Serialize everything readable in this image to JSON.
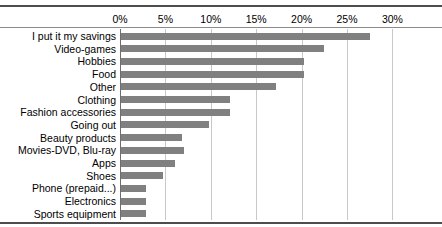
{
  "chart_data": {
    "type": "bar",
    "orientation": "horizontal",
    "title": "",
    "xlabel": "",
    "ylabel": "",
    "xlim": [
      0,
      30
    ],
    "xtick_labels": [
      "0%",
      "5%",
      "10%",
      "15%",
      "20%",
      "25%",
      "30%"
    ],
    "xticks": [
      0,
      5,
      10,
      15,
      20,
      25,
      30
    ],
    "grid": true,
    "legend": "none",
    "bar_color": "#808080",
    "gridline_color": "#c8c8c8",
    "axis_color": "#6e6e6e",
    "categories": [
      "I put it my savings",
      "Video-games",
      "Hobbies",
      "Food",
      "Other",
      "Clothing",
      "Fashion accessories",
      "Going out",
      "Beauty products",
      "Movies-DVD, Blu-ray",
      "Apps",
      "Shoes",
      "Phone (prepaid...)",
      "Electronics",
      "Sports equipment"
    ],
    "values": [
      27.4,
      22.4,
      20.1,
      20.1,
      17.1,
      12.0,
      12.0,
      9.7,
      6.7,
      6.9,
      5.9,
      4.6,
      2.7,
      2.7,
      2.7
    ]
  }
}
